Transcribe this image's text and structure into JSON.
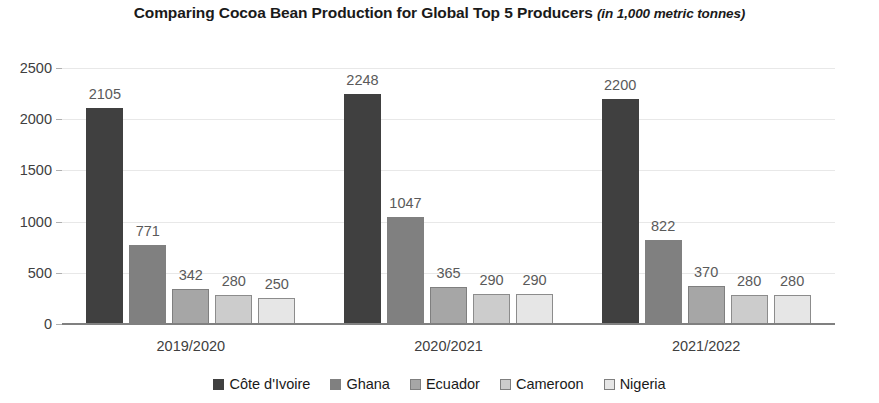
{
  "title": {
    "main": "Comparing Cocoa Bean Production for Global Top 5 Producers ",
    "units": "(in 1,000 metric tonnes)"
  },
  "chart_data": {
    "type": "bar",
    "title": "Comparing Cocoa Bean Production for Global Top 5 Producers (in 1,000 metric tonnes)",
    "subtitle": "(in 1,000 metric tonnes)",
    "xlabel": "",
    "ylabel": "",
    "ylim": [
      0,
      2500
    ],
    "yticks": [
      0,
      500,
      1000,
      1500,
      2000,
      2500
    ],
    "ytick_labels": [
      "0",
      "500",
      "1000",
      "1500",
      "2000",
      "2500"
    ],
    "grid": true,
    "legend_position": "bottom",
    "categories": [
      "2019/2020",
      "2020/2021",
      "2021/2022"
    ],
    "series": [
      {
        "name": "Côte d'Ivoire",
        "color": "#404040",
        "border": "#404040",
        "values": [
          2105,
          2248,
          2200
        ]
      },
      {
        "name": "Ghana",
        "color": "#808080",
        "border": "#808080",
        "values": [
          771,
          1047,
          822
        ]
      },
      {
        "name": "Ecuador",
        "color": "#a6a6a6",
        "border": "#7f7f7f",
        "values": [
          342,
          365,
          370
        ]
      },
      {
        "name": "Cameroon",
        "color": "#cccccc",
        "border": "#8c8c8c",
        "values": [
          280,
          290,
          280
        ]
      },
      {
        "name": "Nigeria",
        "color": "#e6e6e6",
        "border": "#8c8c8c",
        "values": [
          250,
          290,
          280
        ]
      }
    ],
    "data_labels": [
      [
        "2105",
        "771",
        "342",
        "280",
        "250"
      ],
      [
        "2248",
        "1047",
        "365",
        "290",
        "290"
      ],
      [
        "2200",
        "822",
        "370",
        "280",
        "280"
      ]
    ]
  }
}
